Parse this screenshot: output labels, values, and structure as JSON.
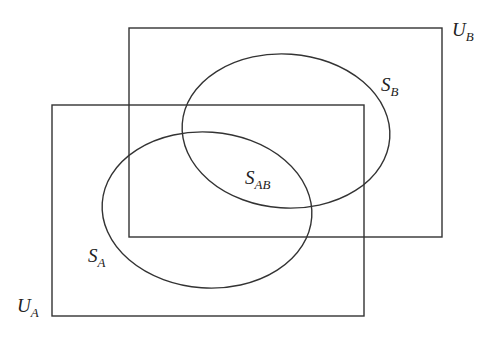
{
  "diagram": {
    "type": "venn",
    "stroke_color": "#333333",
    "background": "#ffffff",
    "universes": [
      {
        "id": "UA",
        "label": "U",
        "subscript": "A",
        "x": 52,
        "y": 105,
        "width": 312,
        "height": 211
      },
      {
        "id": "UB",
        "label": "U",
        "subscript": "B",
        "x": 129,
        "y": 28,
        "width": 313,
        "height": 209
      }
    ],
    "sets": [
      {
        "id": "SA",
        "label": "S",
        "subscript": "A",
        "cx": 207,
        "cy": 210,
        "rx": 105,
        "ry": 78,
        "rotate": 4
      },
      {
        "id": "SB",
        "label": "S",
        "subscript": "B",
        "cx": 286,
        "cy": 131,
        "rx": 104,
        "ry": 77,
        "rotate": 4
      }
    ],
    "labels": {
      "UA": {
        "main": "U",
        "sub": "A",
        "x": 17,
        "y": 312
      },
      "UB": {
        "main": "U",
        "sub": "B",
        "x": 452,
        "y": 36
      },
      "SA": {
        "main": "S",
        "sub": "A",
        "x": 88,
        "y": 262
      },
      "SB": {
        "main": "S",
        "sub": "B",
        "x": 381,
        "y": 91
      },
      "SAB": {
        "main": "S",
        "sub": "AB",
        "x": 245,
        "y": 184
      }
    }
  }
}
